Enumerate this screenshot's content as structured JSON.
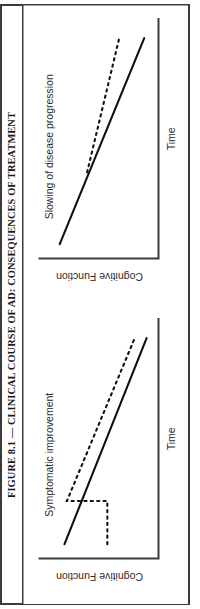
{
  "figure": {
    "caption": "FIGURE 8.1 — CLINICAL COURSE OF AD: CONSEQUENCES OF TREATMENT",
    "orientation_degrees": -90,
    "frame_color": "#3a3a3a",
    "background_color": "#ffffff",
    "ink_color": "#111111"
  },
  "chart_data": [
    {
      "id": "panel-symptomatic-improvement",
      "type": "line",
      "title": "",
      "annotation": "Symptomatic improvement",
      "xlabel": "Time",
      "ylabel": "Cognitive Function",
      "xlim": [
        0,
        10
      ],
      "ylim": [
        0,
        10
      ],
      "grid": false,
      "legend": "none",
      "axis_ticks": false,
      "series": [
        {
          "name": "untreated",
          "style": "solid",
          "x": [
            0.6,
            9.2
          ],
          "values": [
            7.9,
            1.0
          ]
        },
        {
          "name": "treated",
          "style": "dotted",
          "x": [
            0.6,
            2.4,
            2.4,
            9.2
          ],
          "values": [
            4.3,
            4.3,
            7.7,
            2.0
          ]
        }
      ]
    },
    {
      "id": "panel-slowing-of-disease-progression",
      "type": "line",
      "title": "",
      "annotation": "Slowing of disease progression",
      "xlabel": "Time",
      "ylabel": "Cognitive Function",
      "xlim": [
        0,
        10
      ],
      "ylim": [
        0,
        10
      ],
      "grid": false,
      "legend": "none",
      "axis_ticks": false,
      "series": [
        {
          "name": "untreated",
          "style": "solid",
          "x": [
            0.6,
            9.2
          ],
          "values": [
            8.3,
            1.2
          ]
        },
        {
          "name": "treated",
          "style": "dotted",
          "x": [
            3.6,
            9.2
          ],
          "values": [
            6.0,
            3.3
          ]
        }
      ]
    }
  ]
}
